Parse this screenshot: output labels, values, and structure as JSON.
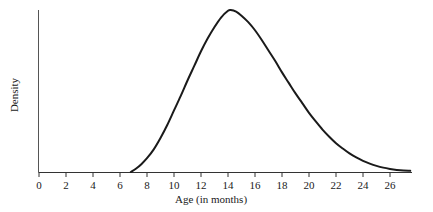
{
  "chart_data": {
    "type": "line",
    "title": "",
    "subtitle": "",
    "xlabel": "Age (in months)",
    "ylabel": "Density",
    "xlim": [
      0,
      27.6
    ],
    "ylim": [
      0,
      1.05
    ],
    "grid": false,
    "legend": null,
    "annotations": [],
    "xticks": [
      0,
      2,
      4,
      6,
      8,
      10,
      12,
      14,
      16,
      18,
      20,
      22,
      24,
      26
    ],
    "xtick_labels": [
      "0",
      "2",
      "4",
      "6",
      "8",
      "10",
      "12",
      "14",
      "16",
      "18",
      "20",
      "22",
      "24",
      "26"
    ],
    "yticks": [],
    "ytick_labels": [],
    "series": [
      {
        "name": "density",
        "color": "#1a1a1a",
        "linewidth": 2.0,
        "x": [
          6.8,
          7.2,
          7.6,
          8.0,
          8.5,
          9.0,
          9.5,
          10.0,
          10.5,
          11.0,
          11.5,
          12.0,
          12.5,
          13.0,
          13.5,
          14.0,
          14.2,
          14.6,
          15.0,
          15.5,
          16.0,
          16.5,
          17.0,
          17.5,
          18.0,
          18.5,
          19.0,
          19.5,
          20.0,
          20.5,
          21.0,
          21.5,
          22.0,
          22.5,
          23.0,
          23.5,
          24.0,
          24.5,
          25.0,
          25.5,
          26.0,
          26.5,
          27.0,
          27.5
        ],
        "y": [
          0.0,
          0.022,
          0.05,
          0.085,
          0.14,
          0.21,
          0.29,
          0.38,
          0.47,
          0.565,
          0.655,
          0.745,
          0.825,
          0.895,
          0.955,
          0.995,
          1.0,
          0.99,
          0.965,
          0.925,
          0.875,
          0.815,
          0.75,
          0.685,
          0.615,
          0.55,
          0.485,
          0.425,
          0.365,
          0.312,
          0.262,
          0.218,
          0.178,
          0.145,
          0.115,
          0.09,
          0.069,
          0.052,
          0.038,
          0.027,
          0.019,
          0.013,
          0.009,
          0.007
        ]
      }
    ],
    "peak": {
      "x": 14.2,
      "y": 1.0
    },
    "onset_x": 6.8,
    "shape": "right-skewed unimodal density curve"
  },
  "axes": {
    "x_axis_label": "Age (in months)",
    "y_axis_label": "Density",
    "axis_color": "#1a1a1a"
  }
}
